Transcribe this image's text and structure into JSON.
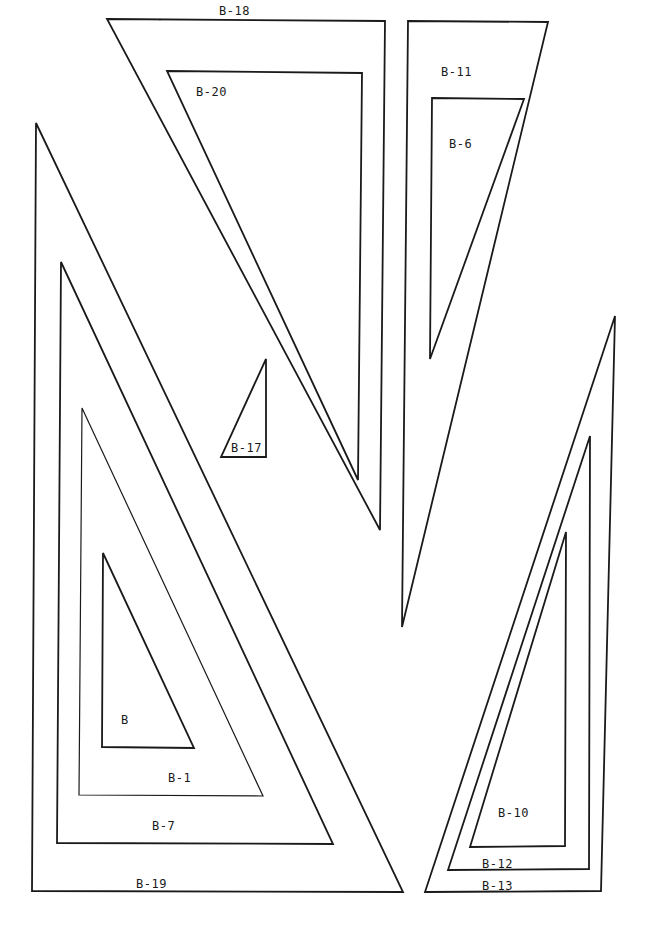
{
  "diagram": {
    "title": "",
    "stroke_color": "#1a1a1a",
    "background": "#ffffff",
    "shapes": [
      {
        "id": "B-19",
        "label": "B-19",
        "points": [
          [
            36,
            123
          ],
          [
            32,
            891
          ],
          [
            403,
            892
          ]
        ],
        "label_pos": [
          136,
          888
        ]
      },
      {
        "id": "B-7",
        "label": "B-7",
        "points": [
          [
            61,
            262
          ],
          [
            57,
            843
          ],
          [
            333,
            844
          ]
        ],
        "label_pos": [
          152,
          830
        ]
      },
      {
        "id": "B-1",
        "label": "B-1",
        "points": [
          [
            82,
            408
          ],
          [
            79,
            795
          ],
          [
            263,
            796
          ]
        ],
        "label_pos": [
          168,
          782
        ]
      },
      {
        "id": "B",
        "label": "B",
        "points": [
          [
            103,
            553
          ],
          [
            102,
            747
          ],
          [
            194,
            748
          ]
        ],
        "label_pos": [
          122,
          724
        ]
      },
      {
        "id": "B-18",
        "label": "B-18",
        "points": [
          [
            107,
            19
          ],
          [
            385,
            21
          ],
          [
            380,
            530
          ]
        ],
        "label_pos": [
          219,
          15
        ]
      },
      {
        "id": "B-20",
        "label": "B-20",
        "points": [
          [
            167,
            71
          ],
          [
            362,
            73
          ],
          [
            358,
            480
          ]
        ],
        "label_pos": [
          196,
          96
        ]
      },
      {
        "id": "B-17",
        "label": "B-17",
        "points": [
          [
            266,
            359
          ],
          [
            266,
            457
          ],
          [
            221,
            457
          ]
        ],
        "label_pos": [
          231,
          452
        ]
      },
      {
        "id": "B-11",
        "label": "B-11",
        "points": [
          [
            408,
            21
          ],
          [
            548,
            22
          ],
          [
            402,
            627
          ]
        ],
        "label_pos": [
          441,
          76
        ]
      },
      {
        "id": "B-6",
        "label": "B-6",
        "points": [
          [
            432,
            98
          ],
          [
            524,
            99
          ],
          [
            430,
            359
          ]
        ],
        "label_pos": [
          449,
          148
        ]
      },
      {
        "id": "B-13",
        "label": "B-13",
        "points": [
          [
            615,
            316
          ],
          [
            601,
            891
          ],
          [
            425,
            892
          ]
        ],
        "label_pos": [
          482,
          890
        ]
      },
      {
        "id": "B-12",
        "label": "B-12",
        "points": [
          [
            590,
            436
          ],
          [
            589,
            869
          ],
          [
            448,
            870
          ]
        ],
        "label_pos": [
          482,
          868
        ]
      },
      {
        "id": "B-10",
        "label": "B-10",
        "points": [
          [
            566,
            532
          ],
          [
            565,
            846
          ],
          [
            470,
            847
          ]
        ],
        "label_pos": [
          498,
          817
        ]
      }
    ],
    "labels": {
      "b19": "B-19",
      "b7": "B-7",
      "b1": "B-1",
      "b": "B",
      "b18": "B-18",
      "b20": "B-20",
      "b17": "B-17",
      "b11": "B-11",
      "b6": "B-6",
      "b13": "B-13",
      "b12": "B-12",
      "b10": "B-10"
    }
  }
}
